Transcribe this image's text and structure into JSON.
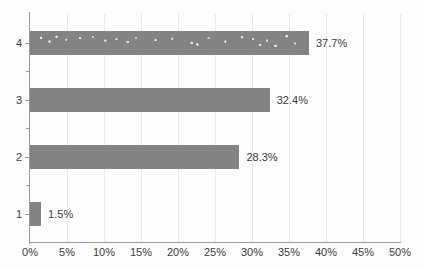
{
  "chart_data": {
    "type": "bar",
    "orientation": "horizontal",
    "title": "",
    "xlabel": "",
    "ylabel": "",
    "categories": [
      "1",
      "2",
      "3",
      "4"
    ],
    "values": [
      1.5,
      28.3,
      32.4,
      37.7
    ],
    "value_labels": [
      "1.5%",
      "28.3%",
      "32.4%",
      "37.7%"
    ],
    "xlim": [
      0,
      50
    ],
    "xticks": [
      0,
      5,
      10,
      15,
      20,
      25,
      30,
      35,
      40,
      45,
      50
    ],
    "xtick_labels": [
      "0%",
      "5%",
      "10%",
      "15%",
      "20%",
      "25%",
      "30%",
      "35%",
      "40%",
      "45%",
      "50%"
    ],
    "grid": true,
    "grid_axis": "x",
    "legend": false,
    "legend_position": "none",
    "bar_color": "#838383",
    "grid_color": "#e4e8ee",
    "axis_color": "#9a9a9a",
    "text_color": "#3b3b3b",
    "background_color": "#ffffff",
    "series": [
      {
        "name": "",
        "points": [
          {
            "category": "4",
            "value": 37.7,
            "label": "37.7%",
            "textured": true
          },
          {
            "category": "3",
            "value": 32.4,
            "label": "32.4%",
            "textured": false
          },
          {
            "category": "2",
            "value": 28.3,
            "label": "28.3%",
            "textured": false
          },
          {
            "category": "1",
            "value": 1.5,
            "label": "1.5%",
            "textured": false
          }
        ]
      }
    ]
  }
}
